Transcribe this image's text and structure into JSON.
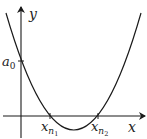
{
  "diagram": {
    "type": "parabola-graph",
    "axes": {
      "x_label": "x",
      "y_label": "y"
    },
    "labels": {
      "y_intercept": "a",
      "y_intercept_sub": "0",
      "root1": "x",
      "root1_sub": "n",
      "root1_subsub": "1",
      "root2": "x",
      "root2_sub": "n",
      "root2_subsub": "2"
    },
    "colors": {
      "line": "#1a1a1a",
      "background": "#ffffff"
    }
  }
}
